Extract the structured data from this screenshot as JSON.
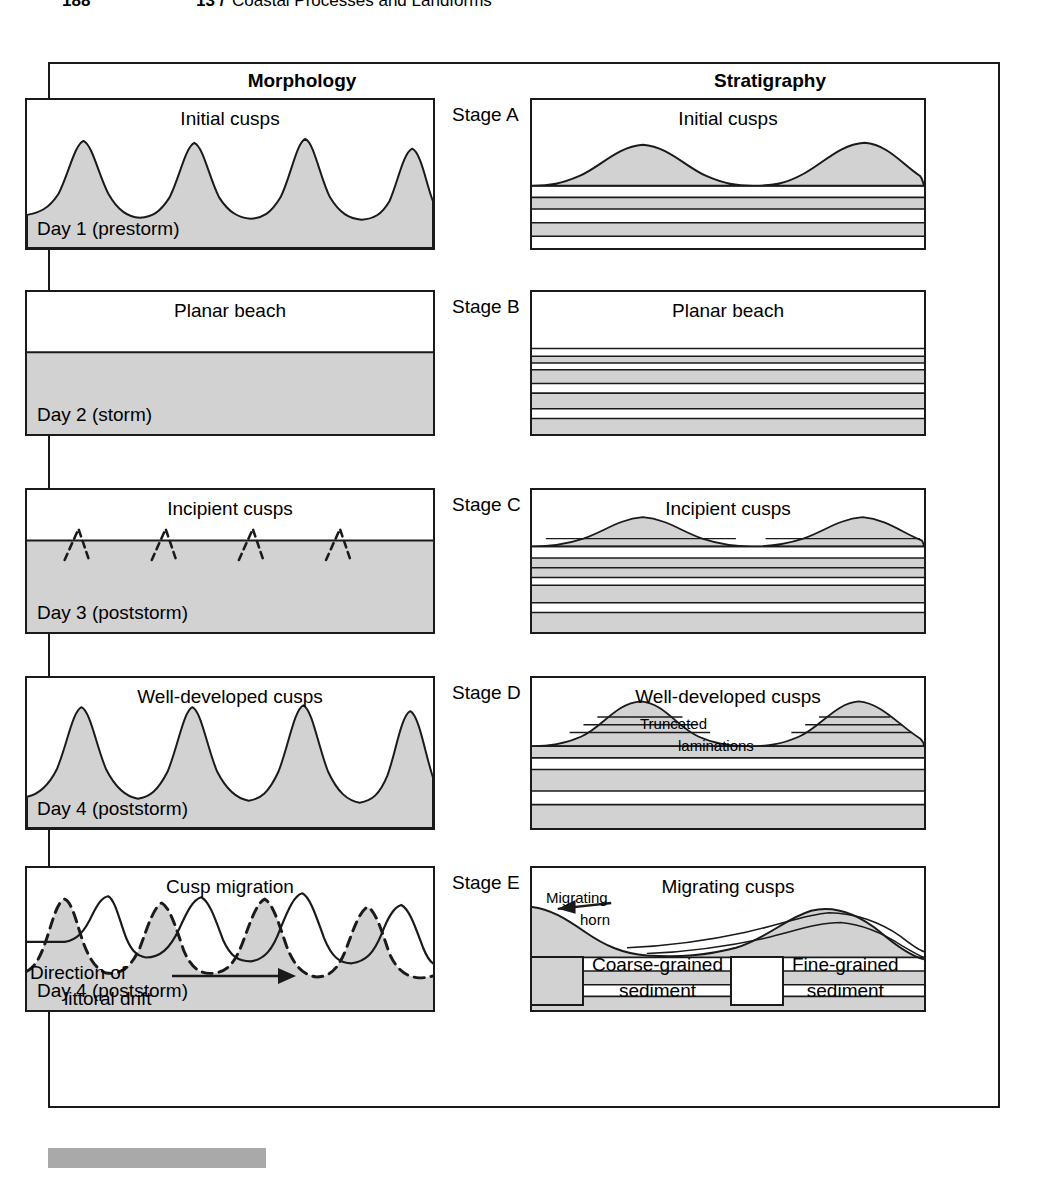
{
  "running_head": {
    "page_number": "188",
    "chapter": "13 /",
    "title": "Coastal Processes and Landforms"
  },
  "columns": {
    "left_header": "Morphology",
    "right_header": "Stratigraphy"
  },
  "colors": {
    "coarse_sediment": "#d2d2d2",
    "fine_sediment": "#ffffff",
    "line": "#1a1a1a"
  },
  "rows": [
    {
      "stage_label": "Stage A",
      "morphology": {
        "title": "Initial cusps",
        "day_label": "Day 1 (prestorm)"
      },
      "stratigraphy": {
        "title": "Initial cusps"
      }
    },
    {
      "stage_label": "Stage B",
      "morphology": {
        "title": "Planar beach",
        "day_label": "Day 2 (storm)"
      },
      "stratigraphy": {
        "title": "Planar beach"
      }
    },
    {
      "stage_label": "Stage C",
      "morphology": {
        "title": "Incipient cusps",
        "day_label": "Day 3 (poststorm)"
      },
      "stratigraphy": {
        "title": "Incipient cusps"
      }
    },
    {
      "stage_label": "Stage D",
      "morphology": {
        "title": "Well-developed cusps",
        "day_label": "Day 4 (poststorm)"
      },
      "stratigraphy": {
        "title": "Well-developed cusps",
        "annotation_line1": "Truncated",
        "annotation_line2": "laminations"
      }
    },
    {
      "stage_label": "Stage E",
      "morphology": {
        "title": "Cusp migration",
        "day_label": "Day 4 (poststorm)"
      },
      "stratigraphy": {
        "title": "Migrating cusps",
        "annotation_line1": "Migrating",
        "annotation_line2": "horn"
      }
    }
  ],
  "drift": {
    "line1": "Direction of",
    "line2": "littoral drift"
  },
  "legend": {
    "coarse": {
      "line1": "Coarse-grained",
      "line2": "sediment"
    },
    "fine": {
      "line1": "Fine-grained",
      "line2": "sediment"
    }
  }
}
